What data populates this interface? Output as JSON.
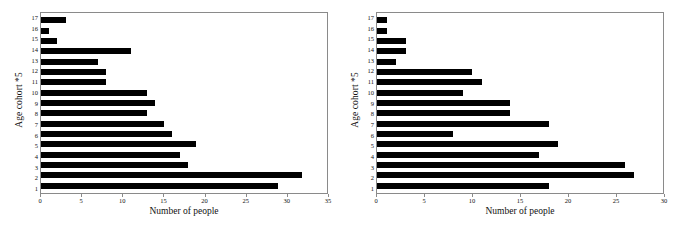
{
  "figure": {
    "background": "#ffffff",
    "bar_color": "#000000",
    "frame_color": "#8a8a8a"
  },
  "panels": [
    {
      "name": "left-panel",
      "chart_data": {
        "type": "bar",
        "orientation": "horizontal",
        "title": "",
        "xlabel": "Number of people",
        "ylabel": "Age cohort *5",
        "categories": [
          "1",
          "2",
          "3",
          "4",
          "5",
          "6",
          "7",
          "8",
          "9",
          "10",
          "11",
          "12",
          "13",
          "14",
          "15",
          "16",
          "17"
        ],
        "values": [
          29,
          32,
          18,
          17,
          19,
          16,
          15,
          13,
          14,
          13,
          8,
          8,
          7,
          11,
          2,
          1,
          3
        ],
        "xlim": [
          0,
          35
        ],
        "xticks": [
          0,
          5,
          10,
          15,
          20,
          25,
          30,
          35
        ],
        "xticklabels": [
          "0",
          "5",
          "10",
          "15",
          "20",
          "25",
          "30",
          "35"
        ],
        "yticklabels": [
          "1",
          "2",
          "3",
          "4",
          "5",
          "6",
          "7",
          "8",
          "9",
          "10",
          "11",
          "12",
          "13",
          "14",
          "15",
          "16",
          "17"
        ],
        "grid": false,
        "legend": false
      }
    },
    {
      "name": "right-panel",
      "chart_data": {
        "type": "bar",
        "orientation": "horizontal",
        "title": "",
        "xlabel": "Number of people",
        "ylabel": "Age cohort *5",
        "categories": [
          "1",
          "2",
          "3",
          "4",
          "5",
          "6",
          "7",
          "8",
          "9",
          "10",
          "11",
          "12",
          "13",
          "14",
          "15",
          "16",
          "17"
        ],
        "values": [
          18,
          27,
          26,
          17,
          19,
          8,
          18,
          14,
          14,
          9,
          11,
          10,
          2,
          3,
          3,
          1,
          1
        ],
        "xlim": [
          0,
          30
        ],
        "xticks": [
          0,
          5,
          10,
          15,
          20,
          25,
          30
        ],
        "xticklabels": [
          "0",
          "5",
          "10",
          "15",
          "20",
          "25",
          "30"
        ],
        "yticklabels": [
          "1",
          "2",
          "3",
          "4",
          "5",
          "6",
          "7",
          "8",
          "9",
          "10",
          "11",
          "12",
          "13",
          "14",
          "15",
          "16",
          "17"
        ],
        "grid": false,
        "legend": false
      }
    }
  ]
}
